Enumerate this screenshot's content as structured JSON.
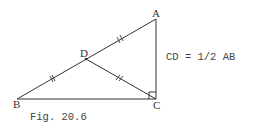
{
  "figure": {
    "caption": "Fig. 20.6",
    "equation": "CD = 1/2 AB",
    "points": {
      "A": {
        "label": "A",
        "x": 156,
        "y": 19
      },
      "B": {
        "label": "B",
        "x": 17,
        "y": 99
      },
      "C": {
        "label": "C",
        "x": 156,
        "y": 99
      },
      "D": {
        "label": "D",
        "x": 86,
        "y": 59
      }
    },
    "segments": [
      "AB",
      "BC",
      "AC",
      "CD"
    ],
    "equal_marks": [
      "AD",
      "DB",
      "DC"
    ],
    "right_angle_at": "C",
    "colors": {
      "stroke": "#333333",
      "text": "#444444",
      "background": "#ffffff"
    }
  }
}
